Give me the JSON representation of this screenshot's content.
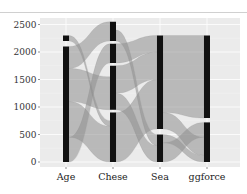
{
  "chart_data": {
    "type": "alluvial",
    "title": "",
    "xlabel": "",
    "ylabel": "",
    "ylim": [
      0,
      2600
    ],
    "y_ticks": [
      0,
      500,
      1000,
      1500,
      2000,
      2500
    ],
    "y_tick_labels": [
      "0",
      "500",
      "1000",
      "1500",
      "2000",
      "2500"
    ],
    "categories": [
      "Age",
      "Chese",
      "Sea",
      "ggforce"
    ],
    "grid": true,
    "legend": "none",
    "strata": [
      {
        "axis": "Age",
        "segments": [
          {
            "from": 0,
            "to": 2100
          },
          {
            "from": 2200,
            "to": 2300
          }
        ]
      },
      {
        "axis": "Chese",
        "segments": [
          {
            "from": 0,
            "to": 900
          },
          {
            "from": 950,
            "to": 1750
          },
          {
            "from": 1800,
            "to": 2150
          },
          {
            "from": 2200,
            "to": 2550
          }
        ]
      },
      {
        "axis": "Sea",
        "segments": [
          {
            "from": 0,
            "to": 500
          },
          {
            "from": 600,
            "to": 2300
          }
        ]
      },
      {
        "axis": "ggforce",
        "segments": [
          {
            "from": 0,
            "to": 720
          },
          {
            "from": 800,
            "to": 2300
          }
        ]
      }
    ],
    "flows": [
      {
        "from_axis": 0,
        "to_axis": 1,
        "from": [
          0,
          450
        ],
        "to": [
          1800,
          2150
        ]
      },
      {
        "from_axis": 0,
        "to_axis": 1,
        "from": [
          450,
          1100
        ],
        "to": [
          0,
          650
        ]
      },
      {
        "from_axis": 0,
        "to_axis": 1,
        "from": [
          1100,
          1700
        ],
        "to": [
          950,
          1550
        ]
      },
      {
        "from_axis": 0,
        "to_axis": 1,
        "from": [
          1700,
          2100
        ],
        "to": [
          2200,
          2550
        ]
      },
      {
        "from_axis": 0,
        "to_axis": 1,
        "from": [
          2200,
          2300
        ],
        "to": [
          650,
          750
        ]
      },
      {
        "from_axis": 1,
        "to_axis": 2,
        "from": [
          0,
          900
        ],
        "to": [
          600,
          1500
        ]
      },
      {
        "from_axis": 1,
        "to_axis": 2,
        "from": [
          950,
          1250
        ],
        "to": [
          0,
          300
        ]
      },
      {
        "from_axis": 1,
        "to_axis": 2,
        "from": [
          1250,
          1750
        ],
        "to": [
          1500,
          2000
        ]
      },
      {
        "from_axis": 1,
        "to_axis": 2,
        "from": [
          1800,
          2150
        ],
        "to": [
          2000,
          2300
        ]
      },
      {
        "from_axis": 1,
        "to_axis": 2,
        "from": [
          2200,
          2400
        ],
        "to": [
          300,
          500
        ]
      },
      {
        "from_axis": 2,
        "to_axis": 3,
        "from": [
          0,
          350
        ],
        "to": [
          450,
          720
        ]
      },
      {
        "from_axis": 2,
        "to_axis": 3,
        "from": [
          350,
          500
        ],
        "to": [
          0,
          120
        ]
      },
      {
        "from_axis": 2,
        "to_axis": 3,
        "from": [
          600,
          900
        ],
        "to": [
          120,
          450
        ]
      },
      {
        "from_axis": 2,
        "to_axis": 3,
        "from": [
          900,
          2300
        ],
        "to": [
          800,
          2300
        ]
      }
    ]
  },
  "header": {
    "text": ""
  }
}
